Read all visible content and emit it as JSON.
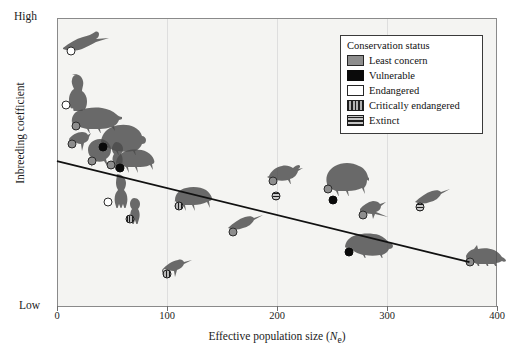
{
  "chart_data": {
    "type": "scatter",
    "title": "",
    "xlabel": "Effective population size (Ne)",
    "ylabel": "Inbreeding coefficient",
    "xlim": [
      0,
      400
    ],
    "ylim": [
      0,
      1
    ],
    "xticks": [
      "0",
      "100",
      "200",
      "300",
      "400"
    ],
    "ytick_low": "Low",
    "ytick_high": "High",
    "grid": "vertical",
    "legend_position": "top-right",
    "trendline": {
      "description": "negative linear fit",
      "x_start": 0,
      "y_start": 0.505,
      "x_end": 375,
      "y_end": 0.155
    },
    "points": [
      {
        "id": "egret",
        "x": 13,
        "y": 0.885,
        "status": "Endangered",
        "animal": "egret-in-flight"
      },
      {
        "id": "chimpanzee",
        "x": 8,
        "y": 0.7,
        "status": "Endangered",
        "animal": "chimpanzee"
      },
      {
        "id": "brown-bear",
        "x": 17,
        "y": 0.625,
        "status": "Least concern",
        "animal": "brown-bear"
      },
      {
        "id": "heron",
        "x": 14,
        "y": 0.565,
        "status": "Least concern",
        "animal": "heron-standing"
      },
      {
        "id": "giant-panda",
        "x": 42,
        "y": 0.555,
        "status": "Vulnerable",
        "animal": "giant-panda"
      },
      {
        "id": "lion",
        "x": 32,
        "y": 0.505,
        "status": "Least concern",
        "animal": "lion"
      },
      {
        "id": "parrot-a",
        "x": 49,
        "y": 0.49,
        "status": "Least concern",
        "animal": "parrot-perched"
      },
      {
        "id": "bison-a",
        "x": 57,
        "y": 0.48,
        "status": "Vulnerable",
        "animal": "bison"
      },
      {
        "id": "gorilla",
        "x": 46,
        "y": 0.365,
        "status": "Endangered",
        "animal": "gorilla"
      },
      {
        "id": "macaw",
        "x": 66,
        "y": 0.305,
        "status": "Critically endangered",
        "animal": "macaw"
      },
      {
        "id": "buffalo",
        "x": 111,
        "y": 0.35,
        "status": "Critically endangered",
        "animal": "buffalo"
      },
      {
        "id": "egret-low",
        "x": 100,
        "y": 0.115,
        "status": "Critically endangered",
        "animal": "egret-low"
      },
      {
        "id": "duck",
        "x": 196,
        "y": 0.435,
        "status": "Least concern",
        "animal": "mallard-duck"
      },
      {
        "id": "duck-extinct",
        "x": 199,
        "y": 0.385,
        "status": "Extinct",
        "animal": ""
      },
      {
        "id": "heron-mid",
        "x": 160,
        "y": 0.26,
        "status": "Least concern",
        "animal": "heron-flying"
      },
      {
        "id": "elephant",
        "x": 246,
        "y": 0.41,
        "status": "Least concern",
        "animal": "elephant"
      },
      {
        "id": "elephant-dot",
        "x": 251,
        "y": 0.37,
        "status": "Vulnerable",
        "animal": ""
      },
      {
        "id": "polar-bear",
        "x": 265,
        "y": 0.19,
        "status": "Vulnerable",
        "animal": "polar-bear"
      },
      {
        "id": "magpie",
        "x": 278,
        "y": 0.32,
        "status": "Least concern",
        "animal": "magpie"
      },
      {
        "id": "heron-right",
        "x": 330,
        "y": 0.345,
        "status": "Extinct",
        "animal": "heron-right"
      },
      {
        "id": "red-fox",
        "x": 375,
        "y": 0.155,
        "status": "Least concern",
        "animal": "red-fox"
      }
    ]
  },
  "legend": {
    "title": "Conservation status",
    "items": [
      {
        "label": "Least concern",
        "swatch": "sw-least"
      },
      {
        "label": "Vulnerable",
        "swatch": "sw-vulnerable"
      },
      {
        "label": "Endangered",
        "swatch": "sw-endangered"
      },
      {
        "label": "Critically endangered",
        "swatch": "sw-critical"
      },
      {
        "label": "Extinct",
        "swatch": "sw-extinct"
      }
    ]
  },
  "colors": {
    "least_concern": "#8d8d8d",
    "vulnerable": "#0a0a0a",
    "endangered": "#ffffff",
    "critically_endangered": "#b9b9b9",
    "extinct": "#c9c9c9",
    "plot_background": "#f4f4f2",
    "axis": "#8a8a8a",
    "gridline": "#dedede",
    "trendline": "#111111"
  }
}
